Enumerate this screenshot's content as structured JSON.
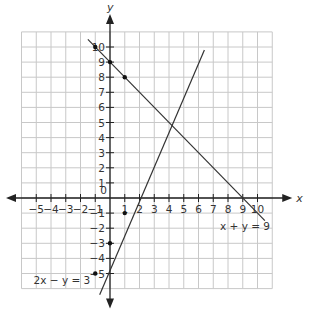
{
  "chart_data": {
    "type": "line",
    "title": "",
    "xlabel": "x",
    "ylabel": "y",
    "xlim": [
      -6,
      11
    ],
    "ylim": [
      -6,
      11
    ],
    "grid": true,
    "x_ticks": [
      -5,
      -4,
      -3,
      -2,
      -1,
      1,
      2,
      3,
      4,
      5,
      6,
      7,
      8,
      9,
      10
    ],
    "y_ticks": [
      -5,
      -4,
      -3,
      -2,
      -1,
      1,
      2,
      3,
      4,
      5,
      6,
      7,
      8,
      9,
      10
    ],
    "origin_label": "0",
    "series": [
      {
        "name": "x + y = 9",
        "equation": "x + y = 9",
        "x": [
          -1.5,
          10.5
        ],
        "y": [
          10.5,
          -1.5
        ],
        "points": [
          [
            -1,
            10
          ],
          [
            0,
            9
          ],
          [
            1,
            8
          ]
        ],
        "label_pos": [
          8,
          -2
        ]
      },
      {
        "name": "2x − y = 3",
        "equation": "2x − y = 3",
        "x": [
          -0.7,
          6.4
        ],
        "y": [
          -6.4,
          9.8
        ],
        "points": [
          [
            -1,
            -5
          ],
          [
            0,
            -3
          ],
          [
            1,
            -1
          ]
        ],
        "label_pos": [
          -1.2,
          -5.5
        ]
      }
    ],
    "intersection": [
      4,
      5
    ]
  }
}
